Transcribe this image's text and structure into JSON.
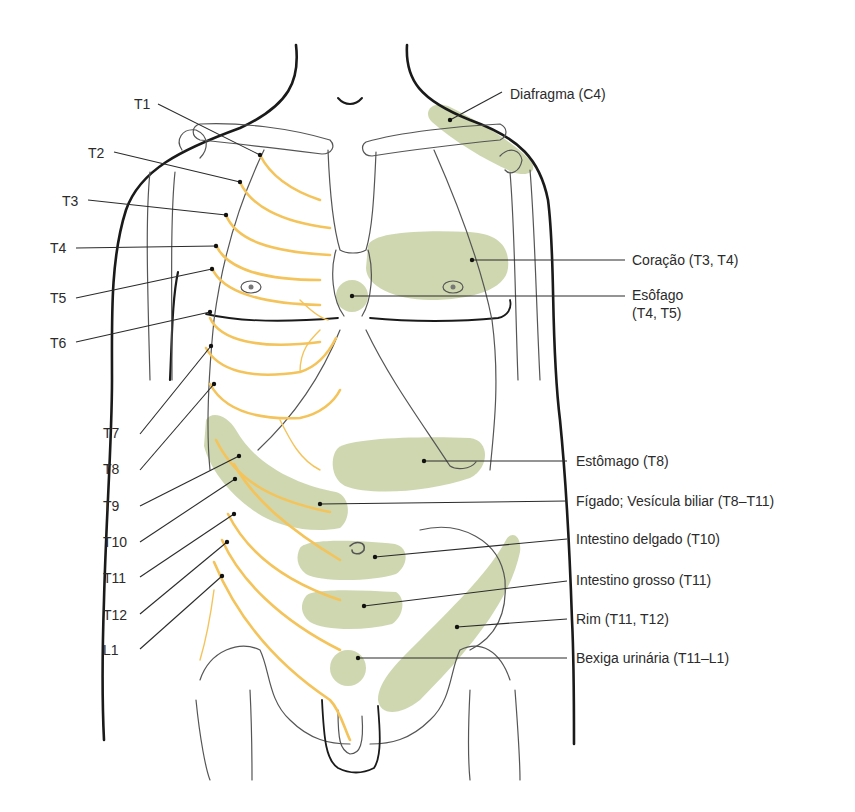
{
  "figure": {
    "colors": {
      "nerve": "#f4c35a",
      "referred_zone": "#c9d3a6",
      "outline": "#1a1a1a",
      "bone": "#555555",
      "text": "#2b2b2b"
    },
    "dermatome_labels": [
      "T1",
      "T2",
      "T3",
      "T4",
      "T5",
      "T6",
      "T7",
      "T8",
      "T9",
      "T10",
      "T11",
      "T12",
      "L1"
    ],
    "organ_labels": {
      "diafragma": "Diafragma (C4)",
      "coracao": "Coração (T3, T4)",
      "esofago_line1": "Esôfago",
      "esofago_line2": "(T4, T5)",
      "estomago": "Estômago (T8)",
      "figado": "Fígado; Vesícula biliar (T8–T11)",
      "intestino_delgado": "Intestino delgado (T10)",
      "intestino_grosso": "Intestino grosso (T11)",
      "rim": "Rim (T11, T12)",
      "bexiga": "Bexiga urinária (T11–L1)"
    }
  }
}
